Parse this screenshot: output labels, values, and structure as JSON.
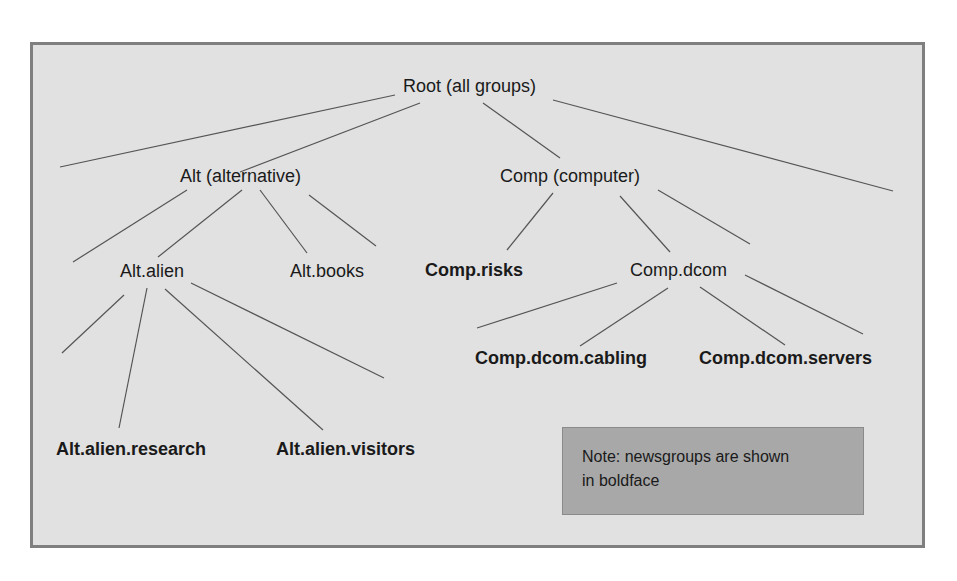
{
  "diagram": {
    "type": "tree",
    "colors": {
      "frame_background": "#e1e1e1",
      "frame_border": "#7f7f7f",
      "note_background": "#a8a8a8",
      "edge": "#555555",
      "text": "#1a1a1a"
    },
    "nodes": {
      "root": {
        "label": "Root (all groups)",
        "bold": false
      },
      "alt": {
        "label": "Alt (alternative)",
        "bold": false
      },
      "comp": {
        "label": "Comp (computer)",
        "bold": false
      },
      "alt_alien": {
        "label": "Alt.alien",
        "bold": false
      },
      "alt_books": {
        "label": "Alt.books",
        "bold": false
      },
      "comp_risks": {
        "label": "Comp.risks",
        "bold": true
      },
      "comp_dcom": {
        "label": "Comp.dcom",
        "bold": false
      },
      "alt_alien_research": {
        "label": "Alt.alien.research",
        "bold": true
      },
      "alt_alien_visitors": {
        "label": "Alt.alien.visitors",
        "bold": true
      },
      "comp_dcom_cabling": {
        "label": "Comp.dcom.cabling",
        "bold": true
      },
      "comp_dcom_servers": {
        "label": "Comp.dcom.servers",
        "bold": true
      }
    },
    "edges": [
      [
        "root",
        "alt"
      ],
      [
        "root",
        "comp"
      ],
      [
        "alt",
        "alt_alien"
      ],
      [
        "alt",
        "alt_books"
      ],
      [
        "comp",
        "comp_risks"
      ],
      [
        "comp",
        "comp_dcom"
      ],
      [
        "alt_alien",
        "alt_alien_research"
      ],
      [
        "alt_alien",
        "alt_alien_visitors"
      ],
      [
        "comp_dcom",
        "comp_dcom_cabling"
      ],
      [
        "comp_dcom",
        "comp_dcom_servers"
      ]
    ],
    "note": {
      "line1": "Note: newsgroups are shown",
      "line2": "in boldface"
    }
  }
}
